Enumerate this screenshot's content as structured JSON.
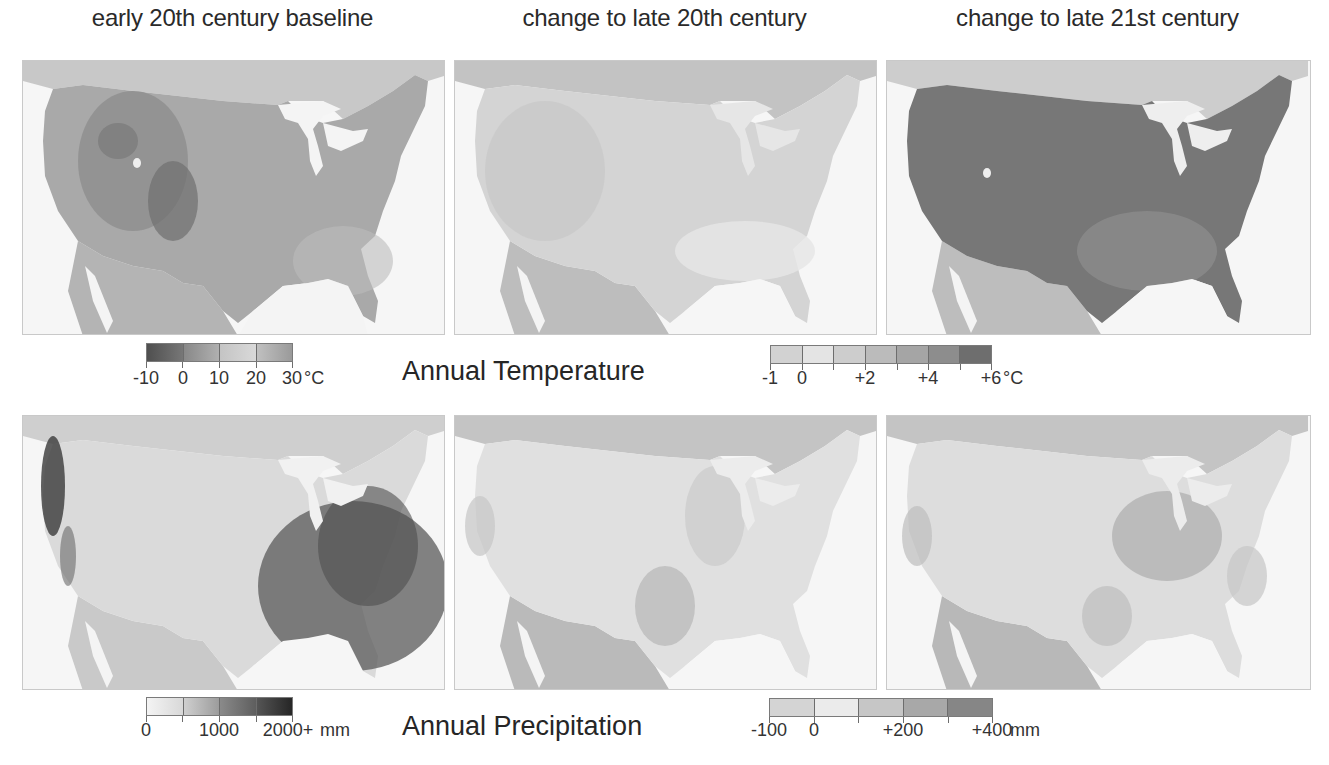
{
  "columns": [
    {
      "title": "early 20th century baseline"
    },
    {
      "title": "change to late 20th century"
    },
    {
      "title": "change to late 21st century"
    }
  ],
  "rows": [
    {
      "label": "Annual Temperature",
      "baseline_colorbar": {
        "ticks": [
          "-10",
          "0",
          "10",
          "20",
          "30"
        ],
        "unit": "°C",
        "segment_colors": [
          "#555555",
          "#8e8e8e",
          "#c9c9c9",
          "#a8a8a8"
        ]
      },
      "change_colorbar": {
        "ticks": [
          "-1",
          "0",
          "+2",
          "+4",
          "+6"
        ],
        "unit": "°C",
        "segment_colors": [
          "#d0d0d0",
          "#e2e2e2",
          "#cbcbcb",
          "#b8b8b8",
          "#a2a2a2",
          "#8c8c8c",
          "#6e6e6e"
        ]
      },
      "panels": [
        {
          "name": "temperature-baseline-map",
          "land_tone": "#a9a9a9",
          "mountain_tone": "#6f6f6f"
        },
        {
          "name": "temperature-change-late20-map",
          "land_tone": "#d2d2d2",
          "accent_tone": "#c2c2c2"
        },
        {
          "name": "temperature-change-late21-map",
          "land_tone": "#777777",
          "accent_tone": "#8e8e8e"
        }
      ]
    },
    {
      "label": "Annual Precipitation",
      "baseline_colorbar": {
        "ticks": [
          "0",
          "1000",
          "2000+"
        ],
        "unit": "mm",
        "segment_colors": [
          "#eeeeee",
          "#b5b5b5",
          "#6f6f6f",
          "#2e2e2e"
        ]
      },
      "change_colorbar": {
        "ticks": [
          "-100",
          "0",
          "+200",
          "+400"
        ],
        "unit": "mm",
        "segment_colors": [
          "#d4d4d4",
          "#ebebeb",
          "#c4c4c4",
          "#a6a6a6",
          "#848484"
        ]
      },
      "panels": [
        {
          "name": "precipitation-baseline-map",
          "land_tone": "#d8d8d8",
          "wet_tone": "#4a4a4a"
        },
        {
          "name": "precipitation-change-late20-map",
          "land_tone": "#dedede",
          "accent_tone": "#bcbcbc"
        },
        {
          "name": "precipitation-change-late21-map",
          "land_tone": "#dcdcdc",
          "accent_tone": "#b3b3b3"
        }
      ]
    }
  ]
}
